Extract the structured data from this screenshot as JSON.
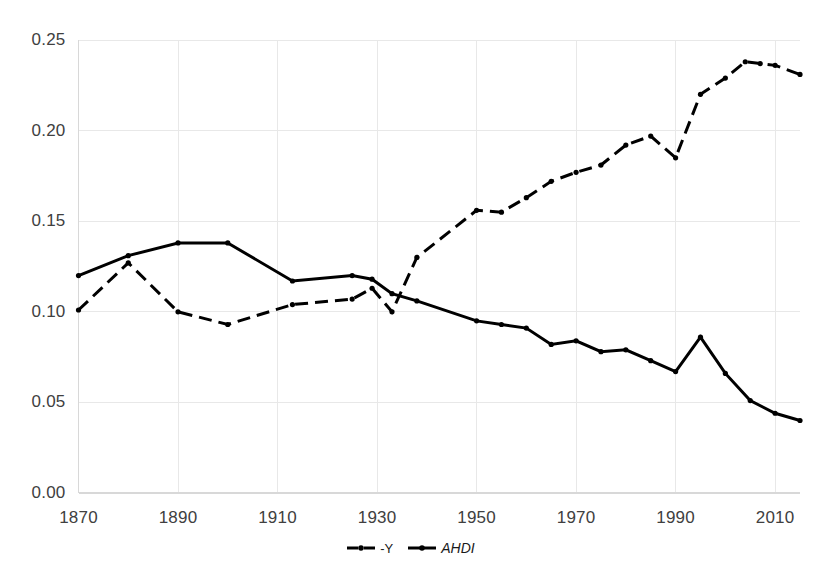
{
  "chart_data": {
    "type": "line",
    "title": "",
    "subtitle": "",
    "xlabel": "",
    "ylabel": "",
    "xlim": [
      1870,
      2015
    ],
    "ylim": [
      0.0,
      0.25
    ],
    "grid": true,
    "legend_position": "bottom-center",
    "x_ticks": [
      "1870",
      "1890",
      "1910",
      "1930",
      "1950",
      "1970",
      "1990",
      "2010"
    ],
    "x_tick_values": [
      1870,
      1890,
      1910,
      1930,
      1950,
      1970,
      1990,
      2010
    ],
    "y_ticks": [
      "0.00",
      "0.05",
      "0.10",
      "0.15",
      "0.20",
      "0.25"
    ],
    "y_tick_values": [
      0.0,
      0.05,
      0.1,
      0.15,
      0.2,
      0.25
    ],
    "series": [
      {
        "name": "-Y",
        "style": "dashed",
        "color": "#000000",
        "marker": "circle",
        "x": [
          1870,
          1880,
          1890,
          1900,
          1913,
          1925,
          1929,
          1933,
          1938,
          1950,
          1955,
          1960,
          1965,
          1970,
          1975,
          1980,
          1985,
          1990,
          1995,
          2000,
          2004,
          2007,
          2010,
          2015
        ],
        "values": [
          0.101,
          0.127,
          0.1,
          0.093,
          0.104,
          0.107,
          0.113,
          0.1,
          0.13,
          0.156,
          0.155,
          0.163,
          0.172,
          0.177,
          0.181,
          0.192,
          0.197,
          0.185,
          0.22,
          0.229,
          0.238,
          0.237,
          0.236,
          0.231
        ]
      },
      {
        "name": "AHDI",
        "style": "solid",
        "color": "#000000",
        "marker": "circle",
        "x": [
          1870,
          1880,
          1890,
          1900,
          1913,
          1925,
          1929,
          1933,
          1938,
          1950,
          1955,
          1960,
          1965,
          1970,
          1975,
          1980,
          1985,
          1990,
          1995,
          2000,
          2005,
          2010,
          2015
        ],
        "values": [
          0.12,
          0.131,
          0.138,
          0.138,
          0.117,
          0.12,
          0.118,
          0.11,
          0.106,
          0.095,
          0.093,
          0.091,
          0.082,
          0.084,
          0.078,
          0.079,
          0.073,
          0.067,
          0.086,
          0.066,
          0.051,
          0.044,
          0.04
        ]
      }
    ]
  },
  "legend": {
    "entries": [
      {
        "label": "-Y",
        "style": "dashed"
      },
      {
        "label": "AHDI",
        "style": "solid"
      }
    ]
  },
  "colors": {
    "line": "#000000",
    "grid": "#e8e8e8",
    "axis": "#d8d8d8",
    "text": "#404040"
  }
}
